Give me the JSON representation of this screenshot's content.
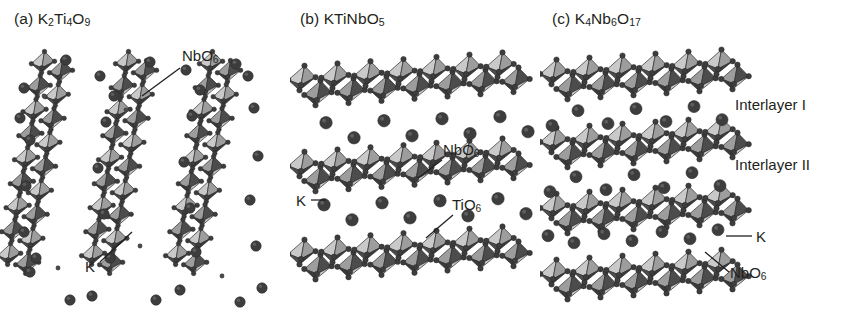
{
  "figure": {
    "background_color": "#ffffff"
  },
  "palette": {
    "octahedron_light": "#c9c9c9",
    "octahedron_mid": "#9d9d9d",
    "octahedron_dark": "#4c4c4c",
    "octahedron_darker": "#3a3a3a",
    "sphere_fill": "#3d3d3d",
    "sphere_small": "#4a4a4a",
    "edge_stroke": "#2b2b2b",
    "text_color": "#231f20",
    "leader_stroke": "#231f20"
  },
  "panels": [
    {
      "id": "a",
      "tag": "(a)",
      "formula_html": "K<sub>2</sub>Ti<sub>4</sub>O<sub>9</sub>",
      "formula_plain": "K2Ti4O9",
      "title": "(a) K2Ti4O9",
      "structure_type": "tilted-ribbons",
      "ribbon_count": 3,
      "ribbon_tilt_deg": 10,
      "annotations": [
        {
          "label_html": "NbO<sub>6</sub>",
          "label_plain": "NbO6",
          "x": 182,
          "y": 47,
          "leader": {
            "x1": 180,
            "y1": 68,
            "x2": 142,
            "y2": 96
          }
        },
        {
          "label_html": "K",
          "label_plain": "K",
          "x": 85,
          "y": 258,
          "leader": {
            "x1": 100,
            "y1": 262,
            "x2": 132,
            "y2": 232
          }
        }
      ]
    },
    {
      "id": "b",
      "tag": "(b)",
      "formula_html": "KTiNbO<sub>5</sub>",
      "formula_plain": "KTiNbO5",
      "title": "(b) KTiNbO5",
      "structure_type": "horizontal-slabs",
      "slab_count": 3,
      "annotations": [
        {
          "label_html": "NbO<sub>6</sub>",
          "label_plain": "NbO6",
          "x": 153,
          "y": 141,
          "leader": {
            "x1": 152,
            "y1": 160,
            "x2": 128,
            "y2": 178
          }
        },
        {
          "label_html": "K",
          "label_plain": "K",
          "x": 6,
          "y": 192,
          "leader": {
            "x1": 21,
            "y1": 200,
            "x2": 36,
            "y2": 200
          }
        },
        {
          "label_html": "TiO<sub>6</sub>",
          "label_plain": "TiO6",
          "x": 162,
          "y": 196,
          "leader": {
            "x1": 163,
            "y1": 215,
            "x2": 136,
            "y2": 238
          }
        }
      ]
    },
    {
      "id": "c",
      "tag": "(c)",
      "formula_html": "K<sub>4</sub>Nb<sub>6</sub>O<sub>17</sub>",
      "formula_plain": "K4Nb6O17",
      "title": "(c) K4Nb6O17",
      "structure_type": "horizontal-slabs",
      "slab_count": 4,
      "annotations": [
        {
          "label_html": "Interlayer I",
          "label_plain": "Interlayer I",
          "x": 195,
          "y": 96,
          "leader": null
        },
        {
          "label_html": "Interlayer II",
          "label_plain": "Interlayer II",
          "x": 195,
          "y": 156,
          "leader": null
        },
        {
          "label_html": "K",
          "label_plain": "K",
          "x": 216,
          "y": 228,
          "leader": {
            "x1": 186,
            "y1": 236,
            "x2": 212,
            "y2": 236
          }
        },
        {
          "label_html": "NbO<sub>6</sub>",
          "label_plain": "NbO6",
          "x": 190,
          "y": 264,
          "leader": {
            "x1": 189,
            "y1": 272,
            "x2": 165,
            "y2": 252
          }
        }
      ]
    }
  ],
  "legend_terms": {
    "nbo6": "NbO6",
    "tio6": "TiO6",
    "k": "K",
    "interlayer_1": "Interlayer I",
    "interlayer_2": "Interlayer II"
  }
}
